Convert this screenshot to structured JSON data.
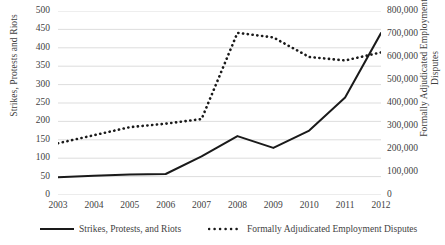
{
  "chart_data": {
    "type": "line",
    "title": "",
    "xlabel": "",
    "categories": [
      "2003",
      "2004",
      "2005",
      "2006",
      "2007",
      "2008",
      "2009",
      "2010",
      "2011",
      "2012"
    ],
    "grid": true,
    "legend_position": "bottom",
    "series": [
      {
        "name": "Strikes, Protests, and Riots",
        "axis": "left",
        "style": "solid",
        "color": "#1a1a1a",
        "values": [
          48,
          52,
          56,
          57,
          105,
          160,
          128,
          175,
          265,
          440
        ]
      },
      {
        "name": "Formally Adjudicated Employment Disputes",
        "axis": "right",
        "style": "dotted",
        "color": "#1a1a1a",
        "values": [
          225000,
          260000,
          295000,
          310000,
          330000,
          705000,
          685000,
          600000,
          585000,
          620000
        ]
      }
    ],
    "left_axis": {
      "label": "Strikes, Protests and Riots",
      "min": 0,
      "max": 500,
      "step": 50,
      "ticks": [
        "0",
        "50",
        "100",
        "150",
        "200",
        "250",
        "300",
        "350",
        "400",
        "450",
        "500"
      ]
    },
    "right_axis": {
      "label_line1": "Formally Adjudicated Employment",
      "label_line2": "Disputes",
      "min": 0,
      "max": 800000,
      "step": 100000,
      "ticks": [
        "0",
        "100,000",
        "200,000",
        "300,000",
        "400,000",
        "500,000",
        "600,000",
        "700,000",
        "800,000"
      ]
    },
    "legend": [
      {
        "label": "Strikes, Protests, and Riots",
        "style": "solid"
      },
      {
        "label": "Formally Adjudicated Employment Disputes",
        "style": "dotted"
      }
    ],
    "colors": {
      "gridline": "#d9d9d9",
      "series": "#1a1a1a",
      "text": "#3f3f3f",
      "background": "#ffffff"
    }
  }
}
